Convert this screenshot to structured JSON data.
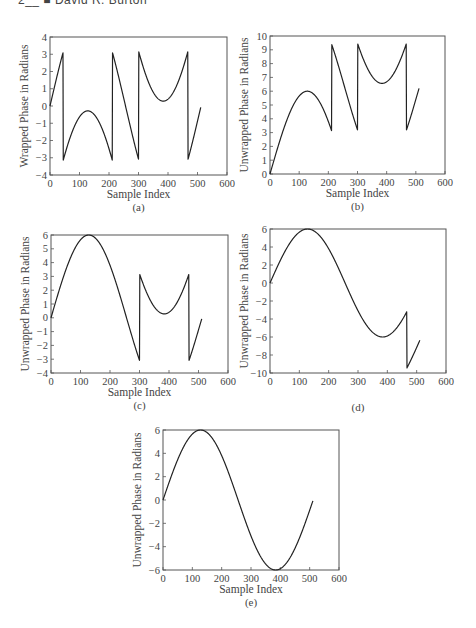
{
  "header": {
    "text": "2__ ■ David R. Burton"
  },
  "chart_data": [
    {
      "id": "a",
      "type": "line",
      "caption": "(a)",
      "xlabel": "Sample Index",
      "ylabel": "Wrapped Phase in Radians",
      "xlim": [
        0,
        600
      ],
      "ylim": [
        -4,
        4
      ],
      "xticks": [
        0,
        100,
        200,
        300,
        400,
        500,
        600
      ],
      "yticks": [
        -4,
        -3,
        -2,
        -1,
        0,
        1,
        2,
        3,
        4
      ],
      "frame": {
        "left": 50,
        "top": 37,
        "right": 227,
        "bottom": 175
      },
      "mode": "wrapped",
      "description": "Wrapped phase of 6*sin(2*pi*n/512), jumps at n~45, 210, 300, 467"
    },
    {
      "id": "b",
      "type": "line",
      "caption": "(b)",
      "xlabel": "Sample Index",
      "ylabel": "Unwrapped Phase in Radians",
      "xlim": [
        0,
        600
      ],
      "ylim": [
        0,
        10
      ],
      "xticks": [
        0,
        100,
        200,
        300,
        400,
        500,
        600
      ],
      "yticks": [
        0,
        1,
        2,
        3,
        4,
        5,
        6,
        7,
        8,
        9,
        10
      ],
      "frame": {
        "left": 270,
        "top": 36,
        "right": 445,
        "bottom": 174
      },
      "mode": "partial1",
      "description": "Partially unwrapped: first wrap removed; remaining wraps shifted by +2pi"
    },
    {
      "id": "c",
      "type": "line",
      "caption": "(c)",
      "xlabel": "Sample Index",
      "ylabel": "Unwrapped Phase in Radians",
      "xlim": [
        0,
        600
      ],
      "ylim": [
        -4,
        6
      ],
      "xticks": [
        0,
        100,
        200,
        300,
        400,
        500,
        600
      ],
      "yticks": [
        -4,
        -3,
        -2,
        -1,
        0,
        1,
        2,
        3,
        4,
        5,
        6
      ],
      "frame": {
        "left": 51,
        "top": 235,
        "right": 228,
        "bottom": 373
      },
      "mode": "partial2",
      "description": "Unwrapped up to n~300; later section still wrapped"
    },
    {
      "id": "d",
      "type": "line",
      "caption": "(d)",
      "xlabel": "",
      "ylabel": "Unwrapped Phase in Radians",
      "xlim": [
        0,
        600
      ],
      "ylim": [
        -10,
        6
      ],
      "xticks": [
        0,
        100,
        200,
        300,
        400,
        500,
        600
      ],
      "yticks": [
        -10,
        -8,
        -6,
        -4,
        -2,
        0,
        2,
        4,
        6
      ],
      "frame": {
        "left": 270,
        "top": 229,
        "right": 446,
        "bottom": 373
      },
      "mode": "partial3",
      "description": "Unwrapped up to n~467; final segment offset by -2pi"
    },
    {
      "id": "e",
      "type": "line",
      "caption": "(e)",
      "xlabel": "Sample Index",
      "ylabel": "Unwrapped Phase in Radians",
      "xlim": [
        0,
        600
      ],
      "ylim": [
        -6,
        6
      ],
      "xticks": [
        0,
        100,
        200,
        300,
        400,
        500,
        600
      ],
      "yticks": [
        -6,
        -4,
        -2,
        0,
        2,
        4,
        6
      ],
      "frame": {
        "left": 163,
        "top": 430,
        "right": 339,
        "bottom": 570
      },
      "mode": "full",
      "description": "Fully unwrapped phase: 6*sin(2*pi*n/512), n=0..511, peak 6 at n~128, trough -6 at n~384"
    }
  ],
  "signal": {
    "amplitude": 6,
    "period": 512,
    "n_max": 511
  }
}
